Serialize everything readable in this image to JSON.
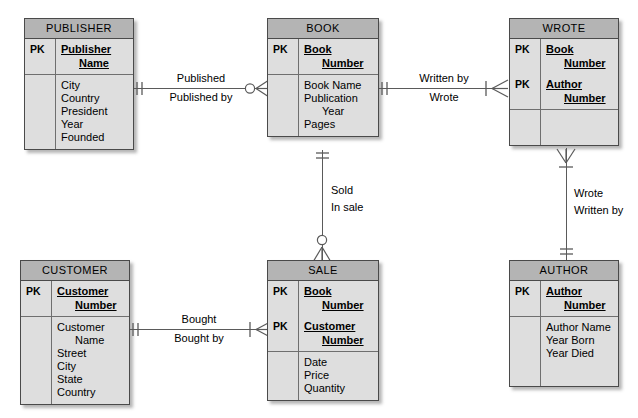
{
  "diagram": {
    "type": "entity-relationship-diagram",
    "notation": "crows-foot",
    "pk_label": "PK",
    "colors": {
      "entity_header": "#b4b4b4",
      "entity_body": "#dedede",
      "border": "#4a4a4a",
      "line": "#5a5a5a",
      "background": "#ffffff"
    }
  },
  "entities": [
    {
      "id": "publisher",
      "title": "PUBLISHER",
      "keys": [
        {
          "pk": "PK",
          "lines": [
            "Publisher",
            "Name"
          ]
        }
      ],
      "attributes": [
        {
          "lines": [
            "City"
          ]
        },
        {
          "lines": [
            "Country"
          ]
        },
        {
          "lines": [
            "President"
          ]
        },
        {
          "lines": [
            "Year Founded"
          ]
        }
      ]
    },
    {
      "id": "book",
      "title": "BOOK",
      "keys": [
        {
          "pk": "PK",
          "lines": [
            "Book",
            "Number"
          ]
        }
      ],
      "attributes": [
        {
          "lines": [
            "Book Name"
          ]
        },
        {
          "lines": [
            "Publication",
            "Year"
          ]
        },
        {
          "lines": [
            "Pages"
          ]
        }
      ]
    },
    {
      "id": "wrote",
      "title": "WROTE",
      "keys": [
        {
          "pk": "PK",
          "lines": [
            "Book",
            "Number"
          ]
        },
        {
          "pk": "PK",
          "lines": [
            "Author",
            "Number"
          ]
        }
      ],
      "attributes": []
    },
    {
      "id": "customer",
      "title": "CUSTOMER",
      "keys": [
        {
          "pk": "PK",
          "lines": [
            "Customer",
            "Number"
          ]
        }
      ],
      "attributes": [
        {
          "lines": [
            "Customer",
            "Name"
          ]
        },
        {
          "lines": [
            "Street"
          ]
        },
        {
          "lines": [
            "City"
          ]
        },
        {
          "lines": [
            "State"
          ]
        },
        {
          "lines": [
            "Country"
          ]
        }
      ]
    },
    {
      "id": "sale",
      "title": "SALE",
      "keys": [
        {
          "pk": "PK",
          "lines": [
            "Book",
            "Number"
          ]
        },
        {
          "pk": "PK",
          "lines": [
            "Customer",
            "Number"
          ]
        }
      ],
      "attributes": [
        {
          "lines": [
            "Date"
          ]
        },
        {
          "lines": [
            "Price"
          ]
        },
        {
          "lines": [
            "Quantity"
          ]
        }
      ]
    },
    {
      "id": "author",
      "title": "AUTHOR",
      "keys": [
        {
          "pk": "PK",
          "lines": [
            "Author",
            "Number"
          ]
        }
      ],
      "attributes": [
        {
          "lines": [
            "Author Name"
          ]
        },
        {
          "lines": [
            "Year Born"
          ]
        },
        {
          "lines": [
            "Year Died"
          ]
        }
      ]
    }
  ],
  "relationships": [
    {
      "id": "publisher-book",
      "from": "PUBLISHER",
      "to": "BOOK",
      "forward_label": "Published",
      "reverse_label": "Published by",
      "from_cardinality": "one-and-only-one",
      "to_cardinality": "zero-or-many"
    },
    {
      "id": "book-wrote",
      "from": "BOOK",
      "to": "WROTE",
      "forward_label": "Written by",
      "reverse_label": "Wrote",
      "from_cardinality": "one-and-only-one",
      "to_cardinality": "one-or-many"
    },
    {
      "id": "book-sale",
      "from": "BOOK",
      "to": "SALE",
      "forward_label": "Sold",
      "reverse_label": "In sale",
      "from_cardinality": "one-and-only-one",
      "to_cardinality": "zero-or-many"
    },
    {
      "id": "wrote-author",
      "from": "WROTE",
      "to": "AUTHOR",
      "forward_label": "Wrote",
      "reverse_label": "Written by",
      "from_cardinality": "one-or-many",
      "to_cardinality": "one-and-only-one"
    },
    {
      "id": "customer-sale",
      "from": "CUSTOMER",
      "to": "SALE",
      "forward_label": "Bought",
      "reverse_label": "Bought by",
      "from_cardinality": "one-and-only-one",
      "to_cardinality": "one-or-many"
    }
  ]
}
